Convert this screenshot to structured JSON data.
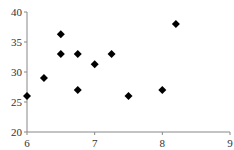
{
  "chart_data": {
    "type": "scatter",
    "title": "",
    "xlabel": "",
    "ylabel": "",
    "xlim": [
      6,
      9
    ],
    "ylim": [
      20,
      40
    ],
    "x_ticks": [
      6,
      7,
      8,
      9
    ],
    "y_ticks": [
      20,
      25,
      30,
      35,
      40
    ],
    "grid": false,
    "legend": null,
    "marker": "diamond",
    "marker_color": "#000000",
    "series": [
      {
        "name": "Series 1",
        "points": [
          {
            "x": 6.0,
            "y": 26
          },
          {
            "x": 6.25,
            "y": 29
          },
          {
            "x": 6.5,
            "y": 36.3
          },
          {
            "x": 6.5,
            "y": 33
          },
          {
            "x": 6.75,
            "y": 33
          },
          {
            "x": 6.75,
            "y": 27
          },
          {
            "x": 7.0,
            "y": 31.3
          },
          {
            "x": 7.25,
            "y": 33
          },
          {
            "x": 7.5,
            "y": 26
          },
          {
            "x": 8.0,
            "y": 27
          },
          {
            "x": 8.2,
            "y": 38
          }
        ]
      }
    ]
  },
  "colors": {
    "axis": "#888888",
    "text": "#333333",
    "marker": "#000000"
  }
}
